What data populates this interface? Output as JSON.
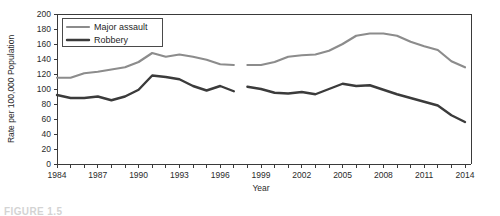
{
  "figure": {
    "caption_partial": "FIGURE 1.5"
  },
  "chart_data": {
    "type": "line",
    "title": "",
    "xlabel": "Year",
    "ylabel": "Rate per 100,000 Population",
    "xlim": [
      1984,
      2014
    ],
    "ylim": [
      0,
      200
    ],
    "ytick_step": 20,
    "xtick_step_labeled": 3,
    "grid": false,
    "legend_position": "top-left",
    "x": [
      1984,
      1985,
      1986,
      1987,
      1988,
      1989,
      1990,
      1991,
      1992,
      1993,
      1994,
      1995,
      1996,
      1997,
      1998,
      1999,
      2000,
      2001,
      2002,
      2003,
      2004,
      2005,
      2006,
      2007,
      2008,
      2009,
      2010,
      2011,
      2012,
      2013,
      2014
    ],
    "ytick_labels": [
      "0",
      "20",
      "40",
      "60",
      "80",
      "100",
      "120",
      "140",
      "160",
      "180",
      "200"
    ],
    "xtick_labels": [
      "1984",
      "1987",
      "1990",
      "1993",
      "1996",
      "1999",
      "2002",
      "2005",
      "2008",
      "2011",
      "2014"
    ],
    "series": [
      {
        "name": "Major assault",
        "color": "#8c8c8c",
        "width": 2.2,
        "segments": [
          {
            "x": [
              1984,
              1985,
              1986,
              1987,
              1988,
              1989,
              1990,
              1991,
              1992,
              1993,
              1994,
              1995,
              1996,
              1997
            ],
            "values": [
              115,
              115,
              121,
              123,
              126,
              129,
              136,
              148,
              143,
              146,
              143,
              139,
              133,
              132
            ]
          },
          {
            "x": [
              1998,
              1999,
              2000,
              2001,
              2002,
              2003,
              2004,
              2005,
              2006,
              2007,
              2008,
              2009,
              2010,
              2011,
              2012,
              2013,
              2014
            ],
            "values": [
              132,
              132,
              136,
              143,
              145,
              146,
              151,
              160,
              171,
              174,
              174,
              171,
              163,
              157,
              152,
              137,
              129
            ]
          }
        ]
      },
      {
        "name": "Robbery",
        "color": "#3b3b3b",
        "width": 2.4,
        "segments": [
          {
            "x": [
              1984,
              1985,
              1986,
              1987,
              1988,
              1989,
              1990,
              1991,
              1992,
              1993,
              1994,
              1995,
              1996,
              1997
            ],
            "values": [
              92,
              88,
              88,
              90,
              85,
              90,
              99,
              118,
              116,
              113,
              104,
              98,
              104,
              97
            ]
          },
          {
            "x": [
              1998,
              1999,
              2000,
              2001,
              2002,
              2003,
              2004,
              2005,
              2006,
              2007,
              2008,
              2009,
              2010,
              2011,
              2012,
              2013,
              2014
            ],
            "values": [
              103,
              100,
              95,
              94,
              96,
              93,
              100,
              107,
              104,
              105,
              99,
              93,
              88,
              83,
              78,
              65,
              56
            ]
          }
        ]
      }
    ]
  }
}
